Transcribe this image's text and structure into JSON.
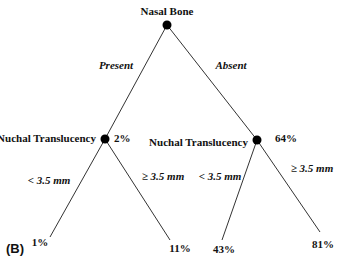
{
  "diagram": {
    "type": "decision-tree",
    "panel_label": "(B)",
    "root": {
      "label": "Nasal Bone"
    },
    "branches": [
      {
        "edge_label": "Present",
        "node": {
          "label": "Nuchal Translucency",
          "value": "2%"
        },
        "children": [
          {
            "edge_label": "< 3.5 mm",
            "value": "1%"
          },
          {
            "edge_label": "≥ 3.5 mm",
            "value": "11%"
          }
        ]
      },
      {
        "edge_label": "Absent",
        "node": {
          "label": "Nuchal Translucency",
          "value": "64%"
        },
        "children": [
          {
            "edge_label": "< 3.5 mm",
            "value": "43%"
          },
          {
            "edge_label": "≥ 3.5 mm",
            "value": "81%"
          }
        ]
      }
    ],
    "colors": {
      "line": "#333333",
      "dot": "#000000",
      "text": "#111111",
      "background": "#ffffff"
    }
  }
}
